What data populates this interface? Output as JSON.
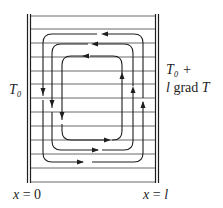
{
  "figure": {
    "type": "convection-cell diagram",
    "left_wall": {
      "label": "T₀",
      "position_label": "x = 0"
    },
    "right_wall": {
      "label_line1": "T₀ +",
      "label_line2": "l grad T",
      "position_label": "x = l"
    },
    "layers": 12,
    "loops": [
      {
        "name": "outer",
        "direction": "counterclockwise",
        "rect": [
          43,
          34,
          143,
          162
        ]
      },
      {
        "name": "middle",
        "direction": "counterclockwise",
        "rect": [
          52,
          44,
          133,
          150
        ]
      },
      {
        "name": "inner",
        "direction": "counterclockwise",
        "rect": [
          62,
          56,
          122,
          140
        ]
      }
    ],
    "colors": {
      "ink": "#1e1e1e",
      "background": "#ffffff"
    }
  },
  "labels": {
    "left_temp": "T₀",
    "right_temp_line1": "T₀ +",
    "right_temp_line2_l": "l",
    "right_temp_line2_grad": " grad ",
    "right_temp_line2_T": "T",
    "x0_x": "x",
    "x0_rest": " = 0",
    "xl_x": "x",
    "xl_eq": " = ",
    "xl_l": "l"
  }
}
